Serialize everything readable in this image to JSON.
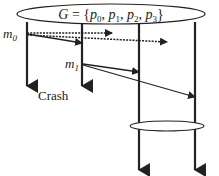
{
  "diagram": {
    "group_label": {
      "prefix": "G = {",
      "members": [
        "p",
        "0",
        ", p",
        "1",
        ", p",
        "2",
        ", p",
        "3",
        "}"
      ],
      "text": "G = {p0, p1, p2, p3}"
    },
    "processes": [
      {
        "id": "p0",
        "x": 27,
        "end_y": 86,
        "crashed": true
      },
      {
        "id": "p1",
        "x": 82,
        "end_y": 86,
        "crashed": true
      },
      {
        "id": "p2",
        "x": 139,
        "end_y": 170,
        "crashed": false
      },
      {
        "id": "p3",
        "x": 195,
        "end_y": 170,
        "crashed": false
      }
    ],
    "messages": [
      {
        "label": "m",
        "sub": "0",
        "from": "p0",
        "to": [
          "p1",
          "p2",
          "p3"
        ],
        "delivered": [
          true,
          false,
          false
        ]
      },
      {
        "label": "m",
        "sub": "1",
        "from": "p1",
        "to": [
          "p2",
          "p3"
        ],
        "delivered": [
          true,
          true
        ]
      }
    ],
    "crash_label": "Crash",
    "new_view_ellipse": {
      "members": [
        "p2",
        "p3"
      ]
    },
    "colors": {
      "line": "#222222",
      "background": "#ffffff"
    }
  }
}
